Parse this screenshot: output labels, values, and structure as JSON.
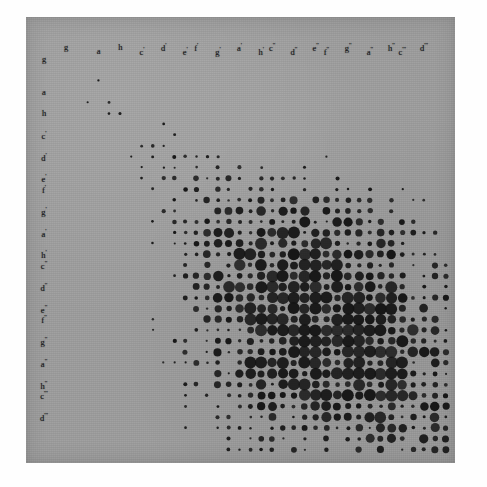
{
  "figure": {
    "title": "Pitch-pair frequency matrix",
    "background_color": "#9d9d9d",
    "dot_color": "#141414",
    "panel": {
      "x": 26,
      "y": 17,
      "width": 429,
      "height": 446
    }
  },
  "chart_data": {
    "type": "scatter",
    "title": "Pitch-pair frequency matrix",
    "xlabel": "",
    "ylabel": "",
    "grid": false,
    "legend": null,
    "size_encoding": "dot radius encodes co-occurrence count",
    "x_tick_labels": [
      "g",
      "a",
      "h",
      "c'",
      "d'",
      "e'",
      "f'",
      "g'",
      "a'",
      "h'",
      "c''",
      "d''",
      "e''",
      "f''",
      "g''",
      "a''",
      "h''",
      "c'''",
      "d'''"
    ],
    "y_tick_labels": [
      "g",
      "a",
      "h",
      "c'",
      "d'",
      "e'",
      "f'",
      "g'",
      "a'",
      "h'",
      "c''",
      "d''",
      "e''",
      "f''",
      "g''",
      "a''",
      "h''",
      "c'''",
      "d'''"
    ],
    "x_tick_cols": [
      0,
      3,
      5,
      7,
      9,
      11,
      12,
      14,
      16,
      18,
      19,
      21,
      23,
      24,
      26,
      28,
      30,
      31,
      33
    ],
    "y_tick_rows": [
      0,
      3,
      5,
      7,
      9,
      11,
      12,
      14,
      16,
      18,
      19,
      21,
      23,
      24,
      26,
      28,
      30,
      31,
      33
    ],
    "grid_cols": 37,
    "grid_rows": 37,
    "xlim": [
      0,
      37
    ],
    "ylim": [
      0,
      37
    ],
    "points": [
      [
        17,
        1,
        1.2
      ],
      [
        24,
        1,
        1.2
      ],
      [
        19,
        2,
        1.3
      ],
      [
        24,
        2,
        1.3
      ],
      [
        38,
        2,
        1.0
      ],
      [
        4,
        3,
        1.4
      ],
      [
        8,
        3,
        1.3
      ],
      [
        17,
        3,
        1.4
      ],
      [
        20,
        3,
        1.3
      ],
      [
        23,
        3,
        1.4
      ],
      [
        36,
        3,
        1.1
      ],
      [
        6,
        4,
        1.5
      ],
      [
        7,
        4,
        1.6
      ],
      [
        18,
        4,
        1.8
      ],
      [
        21,
        4,
        1.4
      ],
      [
        23,
        4,
        1.4
      ],
      [
        25,
        4,
        1.4
      ],
      [
        7,
        5,
        1.5
      ],
      [
        10,
        5,
        1.6
      ],
      [
        12,
        5,
        1.7
      ],
      [
        8,
        6,
        2.6
      ],
      [
        9,
        6,
        1.7
      ],
      [
        12,
        6,
        2.5
      ],
      [
        13,
        6,
        1.6
      ],
      [
        20,
        6,
        1.6
      ],
      [
        23,
        6,
        1.7
      ],
      [
        26,
        6,
        1.6
      ],
      [
        28,
        6,
        1.8
      ],
      [
        10,
        7,
        1.6
      ],
      [
        21,
        7,
        1.5
      ],
      [
        9,
        8,
        1.7
      ],
      [
        10,
        8,
        3.4
      ],
      [
        13,
        8,
        3.1
      ],
      [
        14,
        8,
        1.8
      ],
      [
        18,
        8,
        1.7
      ],
      [
        20,
        8,
        1.7
      ],
      [
        28,
        8,
        1.8
      ],
      [
        6,
        9,
        1.5
      ],
      [
        10,
        9,
        1.8
      ],
      [
        12,
        9,
        3.2
      ],
      [
        15,
        9,
        1.8
      ],
      [
        21,
        9,
        1.7
      ],
      [
        24,
        9,
        1.7
      ],
      [
        30,
        9,
        1.9
      ],
      [
        12,
        10,
        2.0
      ],
      [
        15,
        10,
        2.1
      ],
      [
        16,
        10,
        1.8
      ],
      [
        17,
        10,
        1.7
      ],
      [
        20,
        10,
        1.6
      ],
      [
        12,
        11,
        2.2
      ],
      [
        13,
        11,
        2.8
      ],
      [
        14,
        11,
        2.2
      ],
      [
        15,
        11,
        1.9
      ],
      [
        17,
        11,
        2.0
      ],
      [
        18,
        11,
        1.9
      ],
      [
        20,
        11,
        1.8
      ],
      [
        23,
        11,
        1.8
      ],
      [
        25,
        11,
        1.8
      ],
      [
        28,
        11,
        1.9
      ],
      [
        30,
        11,
        1.7
      ],
      [
        32,
        11,
        1.7
      ],
      [
        34,
        11,
        1.7
      ]
    ],
    "note": "dot sizes digitized from scan; radii in px"
  },
  "dots": [
    {
      "c": 17,
      "r": 1,
      "s": 1.2
    },
    {
      "c": 24,
      "r": 1,
      "s": 1.2
    },
    {
      "c": 19,
      "r": 2,
      "s": 1.3
    },
    {
      "c": 24,
      "r": 2,
      "s": 1.3
    },
    {
      "c": 4,
      "r": 3,
      "s": 1.4
    },
    {
      "c": 8,
      "r": 3,
      "s": 1.3
    },
    {
      "c": 17,
      "r": 3,
      "s": 1.4
    },
    {
      "c": 20,
      "r": 3,
      "s": 1.3
    },
    {
      "c": 23,
      "r": 3,
      "s": 1.4
    },
    {
      "c": 36,
      "r": 3,
      "s": 1.1
    },
    {
      "c": 6,
      "r": 4,
      "s": 1.5
    },
    {
      "c": 7,
      "r": 4,
      "s": 1.6
    },
    {
      "c": 18,
      "r": 4,
      "s": 1.8
    },
    {
      "c": 21,
      "r": 4,
      "s": 1.4
    },
    {
      "c": 23,
      "r": 4,
      "s": 1.4
    },
    {
      "c": 25,
      "r": 4,
      "s": 1.4
    }
  ]
}
